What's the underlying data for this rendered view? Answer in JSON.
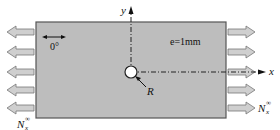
{
  "diagram": {
    "plate": {
      "thickness_label": "e=1mm",
      "fiber_orientation_label": "0°",
      "fill_color": "#bdbdbd",
      "border_color": "#555555"
    },
    "hole": {
      "radius_label": "R"
    },
    "axes": {
      "x_label": "x",
      "y_label": "y"
    },
    "loads": {
      "left_label": "N",
      "left_subscript": "x",
      "left_superscript": "∞",
      "right_label": "N",
      "right_subscript": "x",
      "right_superscript": "∞",
      "arrow_count_per_side": 5,
      "arrow_fill": "#c8c8c8",
      "arrow_stroke": "#777777"
    }
  }
}
